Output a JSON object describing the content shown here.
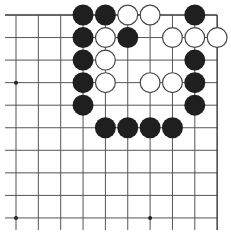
{
  "board": {
    "visible_columns": 10,
    "visible_rows": 10,
    "grid_origin_x": 16,
    "grid_origin_y": 15,
    "spacing_x": 22.35,
    "spacing_y": 22.55,
    "left_overhang": 11,
    "bottom_overhang": 12,
    "edges": {
      "top": true,
      "right": true,
      "left": false,
      "bottom": false
    },
    "line_color": "#555555",
    "edge_color": "#333333",
    "stone_radius": 10.5,
    "star_points": [
      {
        "col": 0,
        "row": 3
      },
      {
        "col": 0,
        "row": 9
      },
      {
        "col": 6,
        "row": 9
      }
    ],
    "stones": [
      {
        "color": "black",
        "col": 3,
        "row": 0
      },
      {
        "color": "black",
        "col": 4,
        "row": 0
      },
      {
        "color": "white",
        "col": 5,
        "row": 0
      },
      {
        "color": "white",
        "col": 6,
        "row": 0
      },
      {
        "color": "black",
        "col": 8,
        "row": 0
      },
      {
        "color": "black",
        "col": 3,
        "row": 1
      },
      {
        "color": "white",
        "col": 4,
        "row": 1
      },
      {
        "color": "black",
        "col": 5,
        "row": 1
      },
      {
        "color": "white",
        "col": 7,
        "row": 1
      },
      {
        "color": "white",
        "col": 8,
        "row": 1
      },
      {
        "color": "white",
        "col": 9,
        "row": 1
      },
      {
        "color": "black",
        "col": 3,
        "row": 2
      },
      {
        "color": "white",
        "col": 4,
        "row": 2
      },
      {
        "color": "black",
        "col": 8,
        "row": 2
      },
      {
        "color": "black",
        "col": 3,
        "row": 3
      },
      {
        "color": "white",
        "col": 4,
        "row": 3
      },
      {
        "color": "white",
        "col": 6,
        "row": 3
      },
      {
        "color": "white",
        "col": 7,
        "row": 3
      },
      {
        "color": "black",
        "col": 8,
        "row": 3
      },
      {
        "color": "black",
        "col": 3,
        "row": 4
      },
      {
        "color": "black",
        "col": 8,
        "row": 4
      },
      {
        "color": "black",
        "col": 4,
        "row": 5
      },
      {
        "color": "black",
        "col": 5,
        "row": 5
      },
      {
        "color": "black",
        "col": 6,
        "row": 5
      },
      {
        "color": "black",
        "col": 7,
        "row": 5
      }
    ],
    "colors": {
      "black_stone": "#1f1f1f",
      "white_stone": "#ffffff",
      "white_outline": "#444444"
    }
  },
  "caption": {
    "text": ""
  }
}
